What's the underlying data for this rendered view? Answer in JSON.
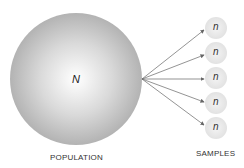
{
  "population": {
    "symbol": "N",
    "label": "POPULATION"
  },
  "samples": {
    "label": "SAMPLES",
    "items": [
      {
        "symbol": "n",
        "cy": 27
      },
      {
        "symbol": "n",
        "cy": 53
      },
      {
        "symbol": "n",
        "cy": 78
      },
      {
        "symbol": "n",
        "cy": 103
      },
      {
        "symbol": "n",
        "cy": 128
      }
    ]
  },
  "colors": {
    "population_fill_edge": "#b5b5b5",
    "population_fill_center": "#ffffff",
    "sample_fill": "#e8e8e8",
    "arrow": "#666666"
  }
}
